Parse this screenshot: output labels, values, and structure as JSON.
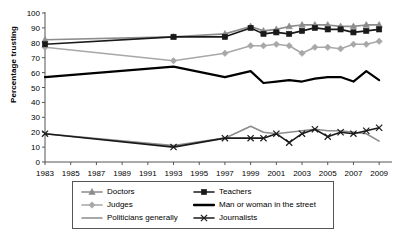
{
  "chart_data": {
    "type": "line",
    "title": "",
    "xlabel": "",
    "ylabel": "Percentage trusting",
    "xlim": [
      1983,
      2010
    ],
    "ylim": [
      0,
      100
    ],
    "ytick_step": 10,
    "grid": false,
    "legend_position": "bottom",
    "yticks": [
      "0",
      "10",
      "20",
      "30",
      "40",
      "50",
      "60",
      "70",
      "80",
      "90",
      "100"
    ],
    "xticks": [
      "1983",
      "1985",
      "1987",
      "1989",
      "1991",
      "1993",
      "1995",
      "1997",
      "1999",
      "2001",
      "2003",
      "2005",
      "2007",
      "2009"
    ],
    "series": [
      {
        "name": "Doctors",
        "color": "#8c8c8c",
        "marker": "triangle",
        "x": [
          1983,
          1993,
          1997,
          1999,
          2000,
          2001,
          2002,
          2003,
          2004,
          2005,
          2006,
          2007,
          2008,
          2009
        ],
        "values": [
          82,
          84,
          86,
          91,
          88,
          89,
          91,
          92,
          92,
          92,
          91,
          91,
          92,
          92
        ]
      },
      {
        "name": "Judges",
        "color": "#a8a8a8",
        "marker": "diamond",
        "x": [
          1983,
          1993,
          1997,
          1999,
          2000,
          2001,
          2002,
          2003,
          2004,
          2005,
          2006,
          2007,
          2008,
          2009
        ],
        "values": [
          77,
          68,
          73,
          78,
          78,
          79,
          78,
          73,
          77,
          77,
          76,
          79,
          79,
          81
        ]
      },
      {
        "name": "Politicians generally",
        "color": "#8c8c8c",
        "marker": "none",
        "x": [
          1983,
          1993,
          1997,
          1999,
          2000,
          2001,
          2002,
          2003,
          2004,
          2005,
          2006,
          2007,
          2008,
          2009
        ],
        "values": [
          19,
          11,
          16,
          24,
          20,
          19,
          20,
          21,
          22,
          21,
          21,
          20,
          19,
          14
        ]
      },
      {
        "name": "Teachers",
        "color": "#1a1a1a",
        "marker": "square",
        "x": [
          1983,
          1993,
          1997,
          1999,
          2000,
          2001,
          2002,
          2003,
          2004,
          2005,
          2006,
          2007,
          2008,
          2009
        ],
        "values": [
          79,
          84,
          84,
          90,
          86,
          87,
          86,
          88,
          90,
          89,
          89,
          87,
          88,
          89
        ]
      },
      {
        "name": "Man or woman in the street",
        "color": "#000000",
        "marker": "none",
        "x": [
          1983,
          1993,
          1997,
          1999,
          2000,
          2001,
          2002,
          2003,
          2004,
          2005,
          2006,
          2007,
          2008,
          2009
        ],
        "values": [
          57,
          64,
          57,
          61,
          53,
          54,
          55,
          54,
          56,
          57,
          57,
          54,
          61,
          55
        ]
      },
      {
        "name": "Journalists",
        "color": "#1a1a1a",
        "marker": "x",
        "x": [
          1983,
          1993,
          1997,
          1999,
          2000,
          2001,
          2002,
          2003,
          2004,
          2005,
          2006,
          2007,
          2008,
          2009
        ],
        "values": [
          19,
          10,
          16,
          16,
          16,
          19,
          13,
          19,
          22,
          17,
          20,
          19,
          21,
          23
        ]
      }
    ]
  },
  "legend": {
    "entries": [
      {
        "label": "Doctors",
        "color": "#8c8c8c",
        "marker": "triangle"
      },
      {
        "label": "Teachers",
        "color": "#1a1a1a",
        "marker": "square"
      },
      {
        "label": "Judges",
        "color": "#a8a8a8",
        "marker": "diamond"
      },
      {
        "label": "Man or woman in the street",
        "color": "#000000",
        "marker": "thickline"
      },
      {
        "label": "Politicians generally",
        "color": "#8c8c8c",
        "marker": "line"
      },
      {
        "label": "Journalists",
        "color": "#1a1a1a",
        "marker": "x"
      }
    ]
  }
}
